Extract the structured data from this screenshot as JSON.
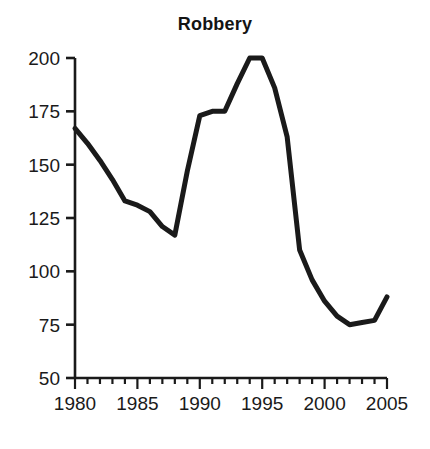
{
  "chart_data": {
    "type": "line",
    "title": "Robbery",
    "xlabel": "",
    "ylabel": "",
    "xlim": [
      1980,
      2005
    ],
    "ylim": [
      50,
      200
    ],
    "grid": false,
    "legend": null,
    "y_ticks": [
      200,
      175,
      150,
      125,
      100,
      75,
      50
    ],
    "y_tick_labels": [
      "200",
      "175",
      "150",
      "125",
      "100",
      "75",
      "50"
    ],
    "x_ticks": [
      1980,
      1985,
      1990,
      1995,
      2000,
      2005
    ],
    "x_tick_labels": [
      "1980",
      "1985",
      "1990",
      "1995",
      "2000",
      "2005"
    ],
    "x_minor_tick_step": 1,
    "line_color": "#1a1a1a",
    "line_width": 5,
    "x": [
      1980,
      1981,
      1982,
      1983,
      1984,
      1985,
      1986,
      1987,
      1988,
      1989,
      1990,
      1991,
      1992,
      1993,
      1994,
      1995,
      1996,
      1997,
      1998,
      1999,
      2000,
      2001,
      2002,
      2003,
      2004,
      2005
    ],
    "values": [
      167,
      160,
      152,
      143,
      133,
      131,
      128,
      121,
      117,
      147,
      173,
      175,
      175,
      188,
      200,
      200,
      186,
      163,
      110,
      96,
      86,
      79,
      75,
      76,
      77,
      88
    ],
    "series": [
      {
        "name": "Robbery",
        "values": [
          167,
          160,
          152,
          143,
          133,
          131,
          128,
          121,
          117,
          147,
          173,
          175,
          175,
          188,
          200,
          200,
          186,
          163,
          110,
          96,
          86,
          79,
          75,
          76,
          77,
          88
        ]
      }
    ]
  },
  "geometry": {
    "x_left_px": 75,
    "x_right_px": 387,
    "y_top_px": 58,
    "y_bottom_px": 378
  }
}
